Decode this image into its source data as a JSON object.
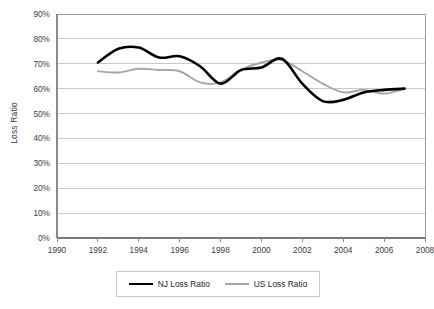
{
  "chart_data": {
    "type": "line",
    "title": "",
    "xlabel": "",
    "ylabel": "Loss Ratio",
    "xlim": [
      1990,
      2008
    ],
    "ylim": [
      0,
      0.9
    ],
    "grid": true,
    "legend_position": "bottom",
    "x_ticks": [
      "1990",
      "1992",
      "1994",
      "1996",
      "1998",
      "2000",
      "2002",
      "2004",
      "2006",
      "2008"
    ],
    "x_tick_values": [
      1990,
      1992,
      1994,
      1996,
      1998,
      2000,
      2002,
      2004,
      2006,
      2008
    ],
    "y_ticks": [
      "0%",
      "10%",
      "20%",
      "30%",
      "40%",
      "50%",
      "60%",
      "70%",
      "80%",
      "90%"
    ],
    "y_tick_values": [
      0,
      10,
      20,
      30,
      40,
      50,
      60,
      70,
      80,
      90
    ],
    "x": [
      1992,
      1993,
      1994,
      1995,
      1996,
      1997,
      1998,
      1999,
      2000,
      2001,
      2002,
      2003,
      2004,
      2005,
      2006,
      2007
    ],
    "series": [
      {
        "name": "NJ Loss Ratio",
        "color": "#000000",
        "width": 2.6,
        "values": [
          70.5,
          76.0,
          76.5,
          72.5,
          73.0,
          69.0,
          62.0,
          67.5,
          68.5,
          72.0,
          62.0,
          55.0,
          55.5,
          58.5,
          59.5,
          60.0
        ]
      },
      {
        "name": "US Loss Ratio",
        "color": "#a6a6a6",
        "width": 1.9,
        "values": [
          67.0,
          66.5,
          68.0,
          67.5,
          67.0,
          62.5,
          62.5,
          67.5,
          70.5,
          71.5,
          67.0,
          62.0,
          58.5,
          59.5,
          58.0,
          60.0
        ]
      }
    ]
  },
  "legend": {
    "entries": [
      {
        "label": "NJ Loss Ratio"
      },
      {
        "label": "US Loss Ratio"
      }
    ]
  },
  "axes": {
    "y_title": "Loss Ratio"
  }
}
